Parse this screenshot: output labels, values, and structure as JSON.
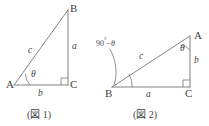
{
  "page": {
    "width": 209,
    "height": 126,
    "background": "#ffffff",
    "ink_color": "#6f6f6f",
    "text_color": "#3f3f3f"
  },
  "figures": [
    {
      "id": "figure-1",
      "caption": "(図 1)",
      "vertices": [
        {
          "name": "A",
          "label": "A",
          "x": 14,
          "y": 85
        },
        {
          "name": "B",
          "label": "B",
          "x": 68,
          "y": 10
        },
        {
          "name": "C",
          "label": "C",
          "x": 68,
          "y": 85
        }
      ],
      "sides": [
        {
          "name": "a",
          "label": "a",
          "between": "B-C",
          "x": 73,
          "y": 46
        },
        {
          "name": "b",
          "label": "b",
          "between": "A-C",
          "x": 39,
          "y": 95
        },
        {
          "name": "c",
          "label": "c",
          "between": "A-B",
          "x": 31,
          "y": 51
        }
      ],
      "angles": [
        {
          "name": "theta",
          "label": "θ",
          "at": "A",
          "x": 32,
          "y": 75
        },
        {
          "name": "right-angle",
          "label": "",
          "at": "C"
        }
      ]
    },
    {
      "id": "figure-2",
      "caption": "(図 2)",
      "vertices": [
        {
          "name": "A",
          "label": "A",
          "x": 196,
          "y": 36
        },
        {
          "name": "B",
          "label": "B",
          "x": 108,
          "y": 94
        },
        {
          "name": "C",
          "label": "C",
          "x": 186,
          "y": 94
        }
      ],
      "sides": [
        {
          "name": "a",
          "label": "a",
          "between": "B-C",
          "x": 148,
          "y": 88
        },
        {
          "name": "b",
          "label": "b",
          "between": "A-C",
          "x": 196,
          "y": 60
        },
        {
          "name": "c",
          "label": "c",
          "between": "A-B",
          "x": 141,
          "y": 56
        }
      ],
      "angles": [
        {
          "name": "theta",
          "label": "θ",
          "at": "A",
          "x": 180,
          "y": 51
        },
        {
          "name": "complement",
          "label_degrees": "90",
          "label_symbol": "°",
          "label_operator": "−",
          "label_theta": "θ",
          "x": 101,
          "y": 38
        },
        {
          "name": "right-angle",
          "label": "",
          "at": "C"
        }
      ]
    }
  ],
  "captions": {
    "figure_1": "(図 1)",
    "figure_2": "(図 2)"
  }
}
